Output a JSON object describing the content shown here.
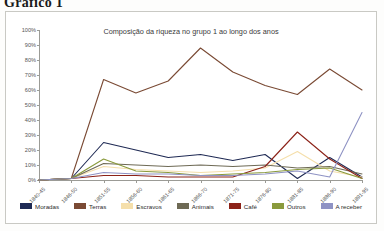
{
  "heading": "Gráfico 1",
  "chart_data": {
    "type": "line",
    "title": "Composição da riqueza no grupo 1 ao longo dos anos",
    "xlabel": "",
    "ylabel": "",
    "ylim": [
      0,
      100
    ],
    "ytick_labels": [
      "100%",
      "90%",
      "80%",
      "70%",
      "60%",
      "50%",
      "40%",
      "30%",
      "20%",
      "10%",
      "0%"
    ],
    "ytick_values": [
      100,
      90,
      80,
      70,
      60,
      50,
      40,
      30,
      20,
      10,
      0
    ],
    "grid": false,
    "legend_position": "bottom",
    "categories": [
      "1840-45",
      "1846-50",
      "1851-55",
      "1856-60",
      "1861-65",
      "1866-70",
      "1871-75",
      "1876-80",
      "1881-85",
      "1886-90",
      "1891-95"
    ],
    "series": [
      {
        "name": "Moradas",
        "color": "#1f2a54",
        "values": [
          0,
          1,
          25,
          20,
          15,
          17,
          13,
          17,
          1,
          15,
          2
        ]
      },
      {
        "name": "Terras",
        "color": "#7a4a34",
        "values": [
          0,
          1,
          67,
          58,
          66,
          88,
          72,
          63,
          57,
          74,
          60
        ]
      },
      {
        "name": "Escravos",
        "color": "#f5dfab",
        "values": [
          0,
          1,
          9,
          7,
          6,
          5,
          6,
          8,
          19,
          6,
          2
        ]
      },
      {
        "name": "Animais",
        "color": "#6e6a55",
        "values": [
          0,
          1,
          11,
          10,
          9,
          10,
          9,
          10,
          8,
          9,
          4
        ]
      },
      {
        "name": "Café",
        "color": "#8c2218",
        "values": [
          0,
          1,
          3,
          3,
          2,
          2,
          2,
          9,
          32,
          14,
          1
        ]
      },
      {
        "name": "Outros",
        "color": "#8a9a3c",
        "values": [
          0,
          1,
          14,
          6,
          5,
          3,
          4,
          5,
          7,
          8,
          1
        ]
      },
      {
        "name": "A receber",
        "color": "#8f93c4",
        "values": [
          0,
          1,
          5,
          4,
          4,
          3,
          3,
          4,
          6,
          2,
          45
        ]
      }
    ]
  }
}
